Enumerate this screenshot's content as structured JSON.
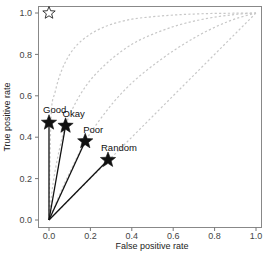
{
  "chart_data": {
    "type": "line",
    "title": "",
    "xlabel": "False positive rate",
    "ylabel": "True positive rate",
    "xlim": [
      0.0,
      1.0
    ],
    "ylim": [
      0.0,
      1.0
    ],
    "grid": false,
    "legend": null,
    "xticks": [
      "0.0",
      "0.2",
      "0.4",
      "0.6",
      "0.8",
      "1.0"
    ],
    "yticks": [
      "0.0",
      "0.2",
      "0.4",
      "0.6",
      "0.8",
      "1.0"
    ],
    "ideal_point": {
      "label": "",
      "x": 0.0,
      "y": 1.0,
      "marker": "hollow-star"
    },
    "points": [
      {
        "label": "Good",
        "x": 0.0,
        "y": 0.47
      },
      {
        "label": "Okay",
        "x": 0.08,
        "y": 0.455
      },
      {
        "label": "Poor",
        "x": 0.175,
        "y": 0.38
      },
      {
        "label": "Random",
        "x": 0.285,
        "y": 0.29
      }
    ],
    "series": [
      {
        "name": "Good curve",
        "style": "dashed",
        "color": "#cccccc",
        "x": [
          0.0,
          0.01,
          0.03,
          0.06,
          0.1,
          0.15,
          0.22,
          0.3,
          0.4,
          0.5,
          0.6,
          0.7,
          0.8,
          0.9,
          1.0
        ],
        "y": [
          0.0,
          0.5,
          0.62,
          0.72,
          0.8,
          0.86,
          0.91,
          0.945,
          0.97,
          0.982,
          0.99,
          0.995,
          0.998,
          0.999,
          1.0
        ]
      },
      {
        "name": "Okay curve",
        "style": "dashed",
        "color": "#cccccc",
        "x": [
          0.0,
          0.02,
          0.05,
          0.08,
          0.12,
          0.18,
          0.25,
          0.33,
          0.42,
          0.52,
          0.62,
          0.72,
          0.82,
          0.91,
          1.0
        ],
        "y": [
          0.0,
          0.18,
          0.34,
          0.455,
          0.55,
          0.65,
          0.73,
          0.8,
          0.86,
          0.905,
          0.94,
          0.965,
          0.983,
          0.994,
          1.0
        ]
      },
      {
        "name": "Poor curve",
        "style": "dashed",
        "color": "#cccccc",
        "x": [
          0.0,
          0.05,
          0.1,
          0.175,
          0.25,
          0.33,
          0.42,
          0.52,
          0.62,
          0.72,
          0.82,
          0.91,
          1.0
        ],
        "y": [
          0.0,
          0.12,
          0.23,
          0.38,
          0.49,
          0.59,
          0.68,
          0.76,
          0.83,
          0.89,
          0.94,
          0.975,
          1.0
        ]
      },
      {
        "name": "Random curve",
        "style": "dashed",
        "color": "#cccccc",
        "x": [
          0.0,
          1.0
        ],
        "y": [
          0.0,
          1.0
        ]
      }
    ]
  },
  "colors": {
    "axis": "#777777",
    "curve": "#c8c8c8",
    "segment": "#111111",
    "star_fill": "#111111"
  }
}
